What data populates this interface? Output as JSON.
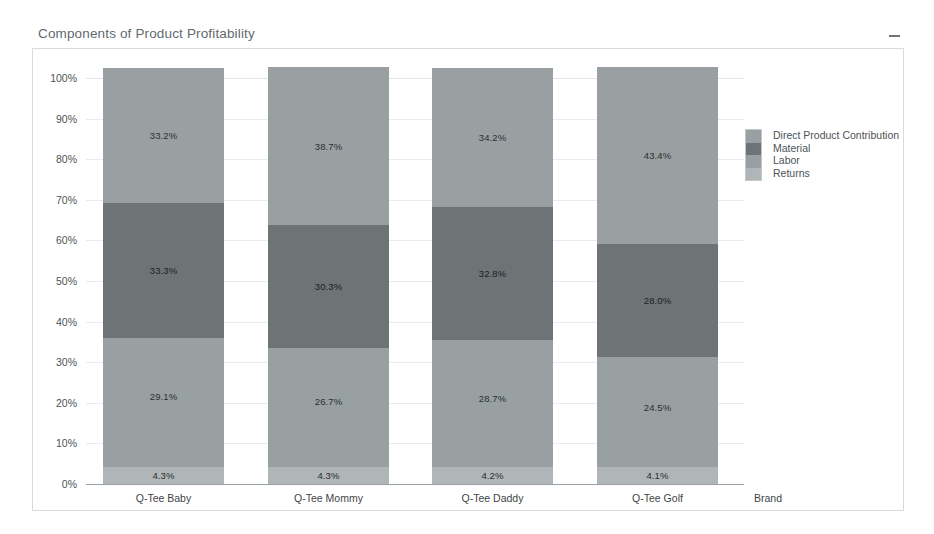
{
  "panel": {
    "title": "Components of Product Profitability",
    "minimize_icon": "minimize-icon"
  },
  "chart_data": {
    "type": "bar",
    "subtype": "stacked-100-percent",
    "title": "Components of Product Profitability",
    "xlabel": "Brand",
    "ylabel": "",
    "ylim": [
      0,
      100
    ],
    "ytick_labels": [
      "100%",
      "90%",
      "80%",
      "70%",
      "60%",
      "50%",
      "40%",
      "30%",
      "20%",
      "10%",
      "0%"
    ],
    "ytick_values": [
      100,
      90,
      80,
      70,
      60,
      50,
      40,
      30,
      20,
      10,
      0
    ],
    "grid": true,
    "legend_position": "right",
    "categories": [
      "Q-Tee Baby",
      "Q-Tee Mommy",
      "Q-Tee Daddy",
      "Q-Tee Golf"
    ],
    "series": [
      {
        "name": "Direct Product Contribution",
        "color": "#9a9fa2",
        "values": [
          33.2,
          38.7,
          34.2,
          43.4
        ],
        "labels": [
          "33.2%",
          "38.7%",
          "34.2%",
          "43.4%"
        ]
      },
      {
        "name": "Material",
        "color": "#6e7376",
        "values": [
          33.3,
          30.3,
          32.8,
          28.0
        ],
        "labels": [
          "33.3%",
          "30.3%",
          "32.8%",
          "28.0%"
        ]
      },
      {
        "name": "Labor",
        "color": "#98a0a2",
        "values": [
          29.1,
          26.7,
          28.7,
          24.5
        ],
        "labels": [
          "29.1%",
          "26.7%",
          "28.7%",
          "24.5%"
        ]
      },
      {
        "name": "Returns",
        "color": "#b0b5b7",
        "values": [
          4.3,
          4.3,
          4.2,
          4.1
        ],
        "labels": [
          "4.3%",
          "4.3%",
          "4.2%",
          "4.1%"
        ]
      }
    ],
    "returns_band_height": 2.6
  },
  "legend": {
    "entries": [
      {
        "label": "Direct Product Contribution",
        "color": "#9a9fa2"
      },
      {
        "label": "Material",
        "color": "#6e7376"
      },
      {
        "label": "Labor",
        "color": "#98a0a2"
      },
      {
        "label": "Returns",
        "color": "#b0b5b7"
      }
    ]
  }
}
